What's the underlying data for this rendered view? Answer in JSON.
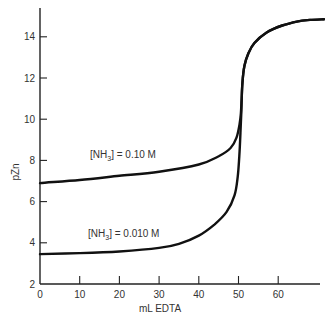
{
  "chart_data": {
    "type": "line",
    "title": "",
    "xlabel": "mL EDTA",
    "ylabel": "pZn",
    "xlim": [
      0,
      72
    ],
    "ylim": [
      2,
      15.2
    ],
    "grid": false,
    "legend": "none (inline curve labels)",
    "x_ticks": [
      0,
      10,
      20,
      30,
      40,
      50,
      60
    ],
    "y_ticks": [
      2,
      4,
      6,
      8,
      10,
      12,
      14
    ],
    "series": [
      {
        "name": "[NH3] = 0.10 M",
        "label_position": {
          "x": 13,
          "y": 7.9
        },
        "points": [
          [
            0,
            6.9
          ],
          [
            10,
            7.05
          ],
          [
            20,
            7.25
          ],
          [
            30,
            7.45
          ],
          [
            40,
            7.8
          ],
          [
            45,
            8.2
          ],
          [
            48,
            8.6
          ],
          [
            49.5,
            9.1
          ],
          [
            50.3,
            9.8
          ],
          [
            50.6,
            10.3
          ],
          [
            50.8,
            11.0
          ],
          [
            51,
            11.8
          ],
          [
            51.5,
            12.6
          ],
          [
            52.5,
            13.2
          ],
          [
            54,
            13.7
          ],
          [
            57,
            14.2
          ],
          [
            61,
            14.55
          ],
          [
            65,
            14.75
          ],
          [
            68,
            14.82
          ],
          [
            71.5,
            14.85
          ]
        ]
      },
      {
        "name": "[NH3] = 0.010 M",
        "label_position": {
          "x": 12,
          "y": 4.1
        },
        "points": [
          [
            0,
            3.45
          ],
          [
            10,
            3.5
          ],
          [
            20,
            3.58
          ],
          [
            30,
            3.75
          ],
          [
            35,
            3.95
          ],
          [
            40,
            4.35
          ],
          [
            44,
            4.9
          ],
          [
            47,
            5.5
          ],
          [
            49,
            6.3
          ],
          [
            49.8,
            7.2
          ],
          [
            50.2,
            8.2
          ],
          [
            50.5,
            9.4
          ],
          [
            50.7,
            10.3
          ],
          [
            50.8,
            11.0
          ],
          [
            51,
            11.8
          ],
          [
            51.5,
            12.6
          ],
          [
            52.5,
            13.2
          ],
          [
            54,
            13.7
          ],
          [
            57,
            14.2
          ],
          [
            61,
            14.55
          ],
          [
            65,
            14.75
          ],
          [
            68,
            14.82
          ],
          [
            71.5,
            14.85
          ]
        ]
      }
    ]
  },
  "labels": {
    "xlabel": "mL EDTA",
    "ylabel": "pZn",
    "series_0_prefix": "[NH",
    "series_0_sub": "3",
    "series_0_suffix": "] = 0.10 M",
    "series_1_prefix": "[NH",
    "series_1_sub": "3",
    "series_1_suffix": "] = 0.010 M"
  }
}
